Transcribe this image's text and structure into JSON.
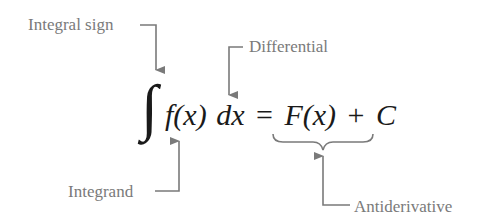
{
  "diagram": {
    "equation": {
      "integral_sign": "∫",
      "integrand": "f(x)",
      "differential": "dx",
      "equals": "=",
      "antiderivative": "F(x)",
      "plus": "+",
      "constant": "C"
    },
    "labels": {
      "integral_sign": "Integral sign",
      "differential": "Differential",
      "integrand": "Integrand",
      "antiderivative": "Antiderivative"
    },
    "colors": {
      "equation": "#1a1a1a",
      "annotation": "#7a7a7a"
    }
  }
}
